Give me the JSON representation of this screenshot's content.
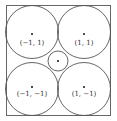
{
  "diagram": {
    "square": {
      "x": 6,
      "y": 5,
      "w": 105,
      "h": 111,
      "stroke": "#666666"
    },
    "circles": [
      {
        "name": "top-left-circle",
        "cx": 32,
        "cy": 32,
        "r": 27,
        "label": "(−1, 1)",
        "label_x": 32,
        "label_y": 42
      },
      {
        "name": "top-right-circle",
        "cx": 84,
        "cy": 32,
        "r": 27,
        "label": "(1, 1)",
        "label_x": 84,
        "label_y": 42
      },
      {
        "name": "bottom-left-circle",
        "cx": 32,
        "cy": 89,
        "r": 27,
        "label": "(−1, −1)",
        "label_x": 32,
        "label_y": 94
      },
      {
        "name": "bottom-right-circle",
        "cx": 84,
        "cy": 89,
        "r": 27,
        "label": "(1, −1)",
        "label_x": 84,
        "label_y": 94
      }
    ],
    "center_circle": {
      "cx": 58,
      "cy": 61,
      "r": 10
    },
    "line_color": "#555555",
    "dot_color": "#111111"
  }
}
